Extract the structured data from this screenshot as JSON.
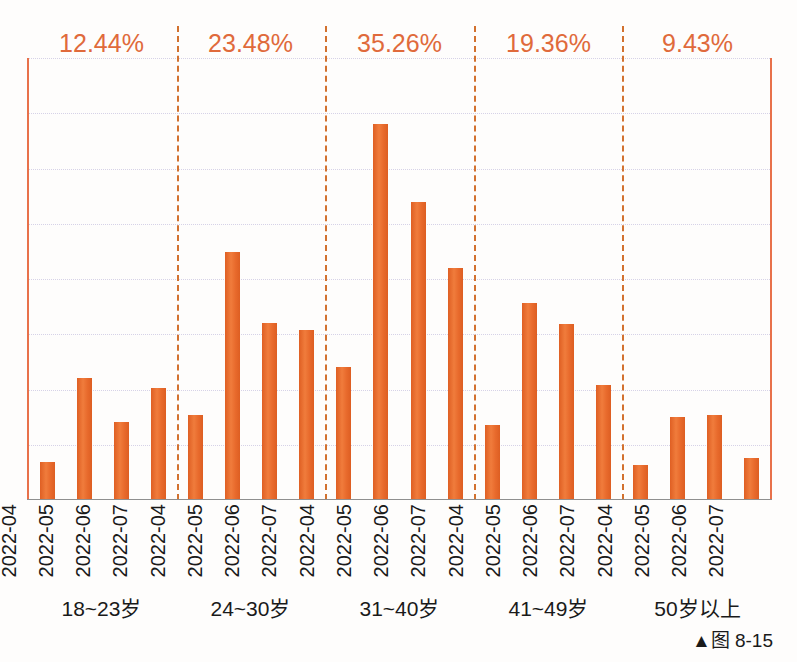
{
  "caption": "▲图 8-15",
  "colors": {
    "bar": "#e8692c",
    "annotation": "#e06a3b",
    "axis": "#e8714b",
    "separator": "#d2712f",
    "gridline": "#c9c4e0",
    "baseline": "#8f8f8f"
  },
  "chart_data": {
    "type": "bar",
    "title": "",
    "xlabel": "",
    "ylabel": "",
    "grid": true,
    "legend": "none",
    "ylim": [
      0,
      40
    ],
    "gridline_count": 8,
    "group_label_name": "age-band",
    "groups": [
      {
        "band": "18~23岁",
        "share": "12.44%",
        "categories": [
          "2022-04",
          "2022-05",
          "2022-06",
          "2022-07"
        ],
        "values": [
          3.4,
          11.0,
          7.1,
          10.1
        ]
      },
      {
        "band": "24~30岁",
        "share": "23.48%",
        "categories": [
          "2022-04",
          "2022-05",
          "2022-06",
          "2022-07"
        ],
        "values": [
          7.7,
          22.4,
          16.0,
          15.4
        ]
      },
      {
        "band": "31~40岁",
        "share": "35.26%",
        "categories": [
          "2022-04",
          "2022-05",
          "2022-06",
          "2022-07"
        ],
        "values": [
          12.0,
          34.0,
          27.0,
          21.0
        ]
      },
      {
        "band": "41~49岁",
        "share": "19.36%",
        "categories": [
          "2022-04",
          "2022-05",
          "2022-06",
          "2022-07"
        ],
        "values": [
          6.8,
          17.8,
          15.9,
          10.4
        ]
      },
      {
        "band": "50岁以上",
        "share": "9.43%",
        "categories": [
          "2022-04",
          "2022-05",
          "2022-06",
          "2022-07"
        ],
        "values": [
          3.2,
          7.5,
          7.7,
          3.8
        ]
      }
    ]
  }
}
